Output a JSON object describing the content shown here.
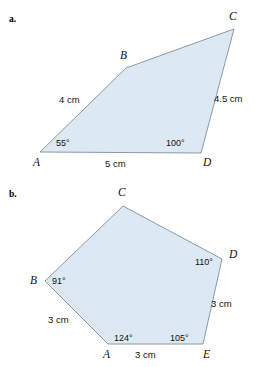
{
  "page": {
    "background_color": "#ffffff",
    "shape_fill_color": "#dce9f2",
    "shape_stroke_color": "#8a9aa6",
    "text_color": "#111111"
  },
  "figures": [
    {
      "id": "figure-a",
      "part_label": "a.",
      "shape": "quadrilateral",
      "vertices": [
        {
          "name": "A",
          "label": "A",
          "x": 40,
          "y": 152,
          "label_x": 33,
          "label_y": 157
        },
        {
          "name": "B",
          "label": "B",
          "x": 126,
          "y": 68,
          "label_x": 120,
          "label_y": 50
        },
        {
          "name": "C",
          "label": "C",
          "x": 234,
          "y": 29,
          "label_x": 229,
          "label_y": 11
        },
        {
          "name": "D",
          "label": "D",
          "x": 201,
          "y": 153,
          "label_x": 203,
          "label_y": 157
        }
      ],
      "side_labels": [
        {
          "name": "side-AB",
          "text": "4 cm",
          "x": 59,
          "y": 95
        },
        {
          "name": "side-CD",
          "text": "4.5 cm",
          "x": 214,
          "y": 94
        },
        {
          "name": "side-AD",
          "text": "5 cm",
          "x": 105,
          "y": 159
        }
      ],
      "angle_labels": [
        {
          "name": "angle-A",
          "text": "55°",
          "x": 56,
          "y": 139
        },
        {
          "name": "angle-D",
          "text": "100°",
          "x": 166,
          "y": 139
        }
      ]
    },
    {
      "id": "figure-b",
      "part_label": "b.",
      "shape": "pentagon",
      "vertices": [
        {
          "name": "A",
          "label": "A",
          "x": 108,
          "y": 344,
          "label_x": 103,
          "label_y": 349
        },
        {
          "name": "B",
          "label": "B",
          "x": 45,
          "y": 281,
          "label_x": 30,
          "label_y": 275
        },
        {
          "name": "C",
          "label": "C",
          "x": 123,
          "y": 206,
          "label_x": 118,
          "label_y": 187
        },
        {
          "name": "D",
          "label": "D",
          "x": 222,
          "y": 259,
          "label_x": 229,
          "label_y": 249
        },
        {
          "name": "E",
          "label": "E",
          "x": 203,
          "y": 344,
          "label_x": 203,
          "label_y": 349
        }
      ],
      "side_labels": [
        {
          "name": "side-BA",
          "text": "3 cm",
          "x": 48,
          "y": 315
        },
        {
          "name": "side-DE",
          "text": "3 cm",
          "x": 211,
          "y": 299
        },
        {
          "name": "side-AE",
          "text": "3 cm",
          "x": 135,
          "y": 350
        }
      ],
      "angle_labels": [
        {
          "name": "angle-B",
          "text": "91°",
          "x": 52,
          "y": 277
        },
        {
          "name": "angle-D",
          "text": "110°",
          "x": 195,
          "y": 258
        },
        {
          "name": "angle-A",
          "text": "124°",
          "x": 114,
          "y": 334
        },
        {
          "name": "angle-E",
          "text": "105°",
          "x": 170,
          "y": 334
        }
      ]
    }
  ]
}
